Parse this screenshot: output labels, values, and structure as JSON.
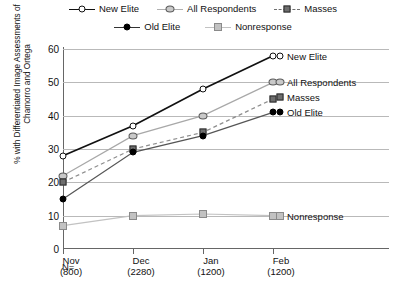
{
  "legend": {
    "rows": [
      [
        {
          "label": "New Elite",
          "key": "open-circle-solid-line"
        },
        {
          "label": "All Respondents",
          "key": "grey-circle-grey-line"
        },
        {
          "label": "Masses",
          "key": "dark-square-dashed-line"
        }
      ],
      [
        {
          "label": "Old Elite",
          "key": "filled-circle-solid-line"
        },
        {
          "label": "Nonresponse",
          "key": "light-square-light-line"
        }
      ]
    ]
  },
  "axes": {
    "ylabel": "% with Differentiated Image Assessments of Chamorro and Ortega",
    "yticks": [
      "0",
      "10",
      "20",
      "30",
      "40",
      "50",
      "60"
    ],
    "n_prefix": "N=",
    "xticks": [
      {
        "month": "Nov",
        "n": "(800)"
      },
      {
        "month": "Dec",
        "n": "(2280)"
      },
      {
        "month": "Jan",
        "n": "(1200)"
      },
      {
        "month": "Feb",
        "n": "(1200)"
      }
    ]
  },
  "chart_data": {
    "type": "line",
    "title": "",
    "xlabel": "",
    "ylabel": "% with Differentiated Image Assessments of Chamorro and Ortega",
    "categories": [
      "Nov",
      "Dec",
      "Jan",
      "Feb"
    ],
    "category_n": [
      800,
      2280,
      1200,
      1200
    ],
    "ylim": [
      0,
      60
    ],
    "ytick_step": 10,
    "grid": true,
    "legend_position": "top-center",
    "end_labels": true,
    "series": [
      {
        "name": "New Elite",
        "values": [
          28,
          37,
          48,
          58
        ],
        "color": "#111111",
        "line": "solid",
        "marker": "open-circle"
      },
      {
        "name": "All Respondents",
        "values": [
          22,
          34,
          40,
          50
        ],
        "color": "#a8a8a8",
        "line": "solid",
        "marker": "grey-circle"
      },
      {
        "name": "Masses",
        "values": [
          20,
          30,
          35,
          45
        ],
        "color": "#8d8d8d",
        "line": "dashed",
        "marker": "dark-square"
      },
      {
        "name": "Old Elite",
        "values": [
          15,
          29,
          34,
          41
        ],
        "color": "#555555",
        "line": "solid",
        "marker": "filled-circle"
      },
      {
        "name": "Nonresponse",
        "values": [
          7,
          10,
          10.5,
          10
        ],
        "color": "#c2c2c2",
        "line": "solid",
        "marker": "light-square"
      }
    ]
  }
}
